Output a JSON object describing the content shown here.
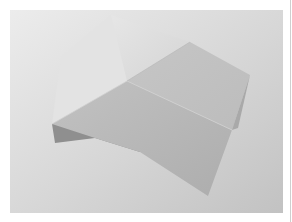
{
  "image": {
    "subject": "folded paper polyhedron",
    "alt": "Photograph of a folded gray paper shape with angular facets on a light gradient background",
    "colors": {
      "background_light": "#e9e9e9",
      "background_dark": "#c4c4c4",
      "face_top": "#dadada",
      "face_left": "#e2e2e2",
      "face_right": "#c9c9c9",
      "face_front": "#b8b8b8",
      "shadow": "#8f8f8f"
    }
  }
}
